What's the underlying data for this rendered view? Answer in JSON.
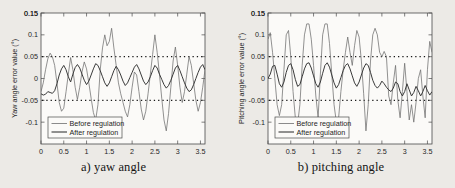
{
  "figure": {
    "panels": [
      {
        "caption": "a) yaw angle",
        "ylabel": "Yaw angle error value (°)",
        "xlabel_prefix": "Time ",
        "xlabel_italic": "t",
        "xlabel_suffix": " (s)",
        "legend": [
          "Before regulation",
          "After regulation"
        ]
      },
      {
        "caption": "b) pitching angle",
        "ylabel": "Pitching angle error value (°)",
        "xlabel_prefix": "Time ",
        "xlabel_italic": "t",
        "xlabel_suffix": " (s)",
        "legend": [
          "Before regulation",
          "After regulation"
        ]
      }
    ]
  },
  "chart_data": [
    {
      "type": "line",
      "title": "a) yaw angle",
      "xlabel": "Time t (s)",
      "ylabel": "Yaw angle error value (°)",
      "xlim": [
        0,
        3.6
      ],
      "ylim": [
        -0.15,
        0.15
      ],
      "xticks": [
        0,
        0.5,
        1,
        1.5,
        2,
        2.5,
        3,
        3.5
      ],
      "xtick_labels": [
        "0",
        "0.5",
        "1",
        "1.5",
        "2",
        "2.5",
        "3",
        "3.5"
      ],
      "yticks": [
        -0.1,
        -0.05,
        0,
        0.05,
        0.1,
        0.15
      ],
      "ytick_labels": [
        "-0.1",
        "-0.05",
        "0",
        "0.05",
        "0.1",
        "0.15"
      ],
      "grid": false,
      "legend_position": "lower-left",
      "reference_lines": [
        {
          "y": 0.05,
          "style": "dotted",
          "color": "#1a1a1a"
        },
        {
          "y": -0.05,
          "style": "dotted",
          "color": "#1a1a1a"
        }
      ],
      "series": [
        {
          "name": "Before regulation",
          "color": "#6e6e6e",
          "x": [
            0.0,
            0.05,
            0.1,
            0.15,
            0.2,
            0.25,
            0.3,
            0.35,
            0.4,
            0.45,
            0.5,
            0.55,
            0.6,
            0.65,
            0.7,
            0.75,
            0.8,
            0.85,
            0.9,
            0.95,
            1.0,
            1.05,
            1.1,
            1.15,
            1.2,
            1.25,
            1.3,
            1.35,
            1.4,
            1.45,
            1.5,
            1.55,
            1.6,
            1.65,
            1.7,
            1.75,
            1.8,
            1.85,
            1.9,
            1.95,
            2.0,
            2.05,
            2.1,
            2.15,
            2.2,
            2.25,
            2.3,
            2.35,
            2.4,
            2.45,
            2.5,
            2.55,
            2.6,
            2.65,
            2.7,
            2.75,
            2.8,
            2.85,
            2.9,
            2.95,
            3.0,
            3.05,
            3.1,
            3.15,
            3.2,
            3.25,
            3.3,
            3.35,
            3.4,
            3.45,
            3.5,
            3.55,
            3.6
          ],
          "y": [
            -0.03,
            -0.01,
            0.02,
            0.045,
            0.058,
            0.05,
            0.03,
            -0.01,
            -0.055,
            -0.075,
            -0.068,
            -0.03,
            0.01,
            0.048,
            0.02,
            -0.02,
            -0.048,
            -0.02,
            0.015,
            0.038,
            0.022,
            -0.01,
            -0.045,
            -0.078,
            -0.095,
            -0.06,
            0.02,
            0.07,
            0.1,
            0.075,
            0.085,
            0.115,
            0.07,
            0.03,
            -0.01,
            -0.035,
            -0.055,
            -0.075,
            -0.088,
            -0.06,
            -0.02,
            0.015,
            0.008,
            -0.03,
            -0.07,
            -0.095,
            -0.075,
            -0.035,
            0.01,
            0.055,
            0.1,
            0.06,
            0.01,
            -0.045,
            -0.095,
            -0.12,
            -0.08,
            -0.02,
            0.04,
            0.072,
            0.03,
            -0.02,
            -0.055,
            -0.03,
            0.01,
            0.05,
            0.03,
            -0.01,
            -0.05,
            -0.075,
            -0.055,
            -0.02,
            0.02
          ]
        },
        {
          "name": "After regulation",
          "color": "#3a3a3a",
          "x": [
            0.0,
            0.05,
            0.1,
            0.15,
            0.2,
            0.25,
            0.3,
            0.35,
            0.4,
            0.45,
            0.5,
            0.55,
            0.6,
            0.65,
            0.7,
            0.75,
            0.8,
            0.85,
            0.9,
            0.95,
            1.0,
            1.05,
            1.1,
            1.15,
            1.2,
            1.25,
            1.3,
            1.35,
            1.4,
            1.45,
            1.5,
            1.55,
            1.6,
            1.65,
            1.7,
            1.75,
            1.8,
            1.85,
            1.9,
            1.95,
            2.0,
            2.05,
            2.1,
            2.15,
            2.2,
            2.25,
            2.3,
            2.35,
            2.4,
            2.45,
            2.5,
            2.55,
            2.6,
            2.65,
            2.7,
            2.75,
            2.8,
            2.85,
            2.9,
            2.95,
            3.0,
            3.05,
            3.1,
            3.15,
            3.2,
            3.25,
            3.3,
            3.35,
            3.4,
            3.45,
            3.5,
            3.55,
            3.6
          ],
          "y": [
            -0.035,
            -0.038,
            -0.036,
            -0.03,
            -0.032,
            -0.034,
            -0.028,
            -0.012,
            0.008,
            0.022,
            0.03,
            0.02,
            0.004,
            -0.008,
            0.01,
            0.025,
            0.032,
            0.024,
            0.01,
            -0.004,
            -0.014,
            -0.006,
            0.008,
            0.022,
            0.034,
            0.03,
            0.018,
            0.004,
            -0.01,
            -0.018,
            -0.01,
            0.004,
            0.018,
            0.028,
            0.02,
            0.008,
            -0.006,
            -0.016,
            -0.01,
            0.002,
            0.014,
            0.026,
            0.032,
            0.022,
            0.008,
            -0.006,
            -0.014,
            -0.008,
            0.004,
            0.018,
            0.03,
            0.024,
            0.01,
            -0.002,
            -0.014,
            -0.022,
            -0.016,
            -0.004,
            0.01,
            0.024,
            0.03,
            0.018,
            0.004,
            -0.01,
            -0.022,
            -0.03,
            -0.026,
            -0.014,
            0.0,
            0.014,
            0.026,
            0.032,
            0.02
          ]
        }
      ]
    },
    {
      "type": "line",
      "title": "b) pitching angle",
      "xlabel": "Time t (s)",
      "ylabel": "Pitching angle error value (°)",
      "xlim": [
        0,
        3.6
      ],
      "ylim": [
        -0.15,
        0.15
      ],
      "xticks": [
        0,
        0.5,
        1,
        1.5,
        2,
        2.5,
        3,
        3.5
      ],
      "xtick_labels": [
        "0",
        "0.5",
        "1",
        "1.5",
        "2",
        "2.5",
        "3",
        "3.5"
      ],
      "yticks": [
        -0.1,
        -0.05,
        0,
        0.05,
        0.1,
        0.15
      ],
      "ytick_labels": [
        "-0.1",
        "-0.05",
        "0",
        "0.05",
        "0.1",
        "0.15"
      ],
      "grid": false,
      "legend_position": "lower-left",
      "reference_lines": [
        {
          "y": 0.05,
          "style": "dotted",
          "color": "#1a1a1a"
        },
        {
          "y": -0.05,
          "style": "dotted",
          "color": "#1a1a1a"
        }
      ],
      "series": [
        {
          "name": "Before regulation",
          "color": "#6e6e6e",
          "x": [
            0.0,
            0.05,
            0.1,
            0.15,
            0.2,
            0.25,
            0.3,
            0.35,
            0.4,
            0.45,
            0.5,
            0.55,
            0.6,
            0.65,
            0.7,
            0.75,
            0.8,
            0.85,
            0.9,
            0.95,
            1.0,
            1.05,
            1.1,
            1.15,
            1.2,
            1.25,
            1.3,
            1.35,
            1.4,
            1.45,
            1.5,
            1.55,
            1.6,
            1.65,
            1.7,
            1.75,
            1.8,
            1.85,
            1.9,
            1.95,
            2.0,
            2.05,
            2.1,
            2.15,
            2.2,
            2.25,
            2.3,
            2.35,
            2.4,
            2.45,
            2.5,
            2.55,
            2.6,
            2.65,
            2.7,
            2.75,
            2.8,
            2.85,
            2.9,
            2.95,
            3.0,
            3.05,
            3.1,
            3.15,
            3.2,
            3.25,
            3.3,
            3.35,
            3.4,
            3.45,
            3.5,
            3.55,
            3.6
          ],
          "y": [
            0.09,
            0.105,
            0.06,
            0.0,
            -0.06,
            -0.085,
            -0.06,
            0.02,
            0.1,
            0.11,
            0.05,
            -0.03,
            -0.09,
            -0.105,
            -0.06,
            0.03,
            0.1,
            0.125,
            0.125,
            0.09,
            0.03,
            -0.04,
            -0.09,
            0.01,
            0.1,
            0.125,
            0.125,
            0.08,
            0.01,
            -0.06,
            -0.1,
            -0.09,
            -0.03,
            0.02,
            0.06,
            0.095,
            0.06,
            0.03,
            0.075,
            0.11,
            0.095,
            0.04,
            -0.035,
            -0.12,
            -0.06,
            0.04,
            0.1,
            0.115,
            0.1,
            0.06,
            0.05,
            0.062,
            0.05,
            -0.04,
            -0.06,
            -0.01,
            0.03,
            -0.05,
            -0.09,
            -0.03,
            0.035,
            -0.03,
            -0.095,
            -0.06,
            -0.1,
            -0.055,
            0.0,
            0.02,
            -0.04,
            -0.09,
            0.02,
            0.085,
            0.06
          ]
        },
        {
          "name": "After regulation",
          "color": "#3a3a3a",
          "x": [
            0.0,
            0.05,
            0.1,
            0.15,
            0.2,
            0.25,
            0.3,
            0.35,
            0.4,
            0.45,
            0.5,
            0.55,
            0.6,
            0.65,
            0.7,
            0.75,
            0.8,
            0.85,
            0.9,
            0.95,
            1.0,
            1.05,
            1.1,
            1.15,
            1.2,
            1.25,
            1.3,
            1.35,
            1.4,
            1.45,
            1.5,
            1.55,
            1.6,
            1.65,
            1.7,
            1.75,
            1.8,
            1.85,
            1.9,
            1.95,
            2.0,
            2.05,
            2.1,
            2.15,
            2.2,
            2.25,
            2.3,
            2.35,
            2.4,
            2.45,
            2.5,
            2.55,
            2.6,
            2.65,
            2.7,
            2.75,
            2.8,
            2.85,
            2.9,
            2.95,
            3.0,
            3.05,
            3.1,
            3.15,
            3.2,
            3.25,
            3.3,
            3.35,
            3.4,
            3.45,
            3.5,
            3.55,
            3.6
          ],
          "y": [
            0.0,
            0.01,
            0.028,
            0.03,
            0.01,
            -0.012,
            -0.02,
            -0.008,
            0.014,
            0.03,
            0.034,
            0.02,
            -0.002,
            -0.018,
            -0.014,
            0.004,
            0.022,
            0.034,
            0.036,
            0.024,
            0.006,
            -0.012,
            -0.02,
            -0.008,
            0.012,
            0.03,
            0.036,
            0.026,
            0.008,
            -0.01,
            -0.022,
            -0.014,
            0.002,
            0.018,
            0.03,
            0.034,
            0.022,
            0.006,
            -0.01,
            -0.018,
            -0.008,
            0.008,
            0.024,
            0.034,
            0.03,
            0.014,
            -0.004,
            -0.016,
            -0.022,
            -0.016,
            -0.006,
            -0.012,
            -0.02,
            -0.026,
            -0.03,
            -0.022,
            -0.008,
            -0.012,
            -0.03,
            -0.04,
            -0.03,
            -0.012,
            -0.026,
            -0.04,
            -0.032,
            -0.018,
            -0.028,
            -0.04,
            -0.03,
            -0.016,
            -0.028,
            -0.038,
            -0.03
          ]
        }
      ]
    }
  ]
}
